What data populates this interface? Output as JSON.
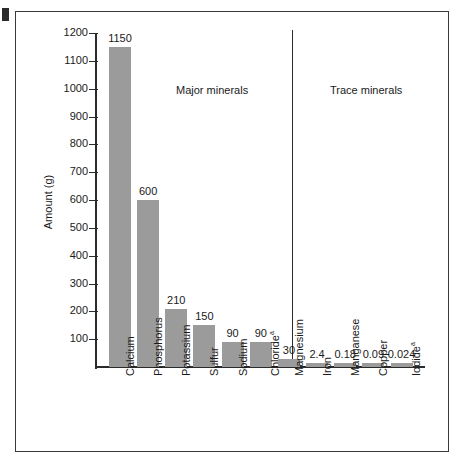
{
  "figure": {
    "y_axis_title": "Amount (g)",
    "section_labels": {
      "major": "Major minerals",
      "trace": "Trace minerals"
    },
    "tick_labels": [
      "1200",
      "1100",
      "1000",
      "900",
      "800",
      "700",
      "600",
      "500",
      "400",
      "300",
      "200",
      "100"
    ],
    "colors": {
      "bar_fill": "#9b9b9b",
      "axis": "#2b2b2b",
      "frame": "#3a3a3a",
      "text": "#1a1a1a",
      "background": "#ffffff"
    },
    "footnote_marker": "a"
  },
  "chart_data": {
    "type": "bar",
    "title": "",
    "xlabel": "",
    "ylabel": "Amount (g)",
    "ylim": [
      0,
      1200
    ],
    "ytick_step": 100,
    "grid": false,
    "legend": "none",
    "annotations": [
      "Major minerals",
      "Trace minerals"
    ],
    "groups": [
      {
        "name": "Major minerals",
        "categories": [
          "Calcium",
          "Phosphorus",
          "Potassium",
          "Sulfur",
          "Sodium",
          "Chloride",
          "Magnesium"
        ]
      },
      {
        "name": "Trace minerals",
        "categories": [
          "Iron",
          "Manganese",
          "Copper",
          "Iodide"
        ]
      }
    ],
    "categories": [
      "Calcium",
      "Phosphorus",
      "Potassium",
      "Sulfur",
      "Sodium",
      "Chloride",
      "Magnesium",
      "Iron",
      "Manganese",
      "Copper",
      "Iodide"
    ],
    "values": [
      1150,
      600,
      210,
      150,
      90,
      90,
      30,
      2.4,
      0.18,
      0.09,
      0.024
    ],
    "value_labels": [
      "1150",
      "600",
      "210",
      "150",
      "90",
      "90",
      "30",
      "2.4",
      "0.18",
      "0.09",
      "0.024"
    ],
    "category_labels": [
      "Calcium",
      "Phosphorus",
      "Potassium",
      "Sulfur",
      "Sodium",
      "Chloride",
      "Magnesium",
      "Iron",
      "Manganese",
      "Copper",
      "Iodide"
    ],
    "category_footnotes": [
      "",
      "",
      "",
      "",
      "",
      "a",
      "",
      "",
      "",
      "",
      "a"
    ],
    "bars": [
      {
        "label": "Calcium",
        "value": 1150,
        "value_label": "1150",
        "footnote": "",
        "group": "major"
      },
      {
        "label": "Phosphorus",
        "value": 600,
        "value_label": "600",
        "footnote": "",
        "group": "major"
      },
      {
        "label": "Potassium",
        "value": 210,
        "value_label": "210",
        "footnote": "",
        "group": "major"
      },
      {
        "label": "Sulfur",
        "value": 150,
        "value_label": "150",
        "footnote": "",
        "group": "major"
      },
      {
        "label": "Sodium",
        "value": 90,
        "value_label": "90",
        "footnote": "",
        "group": "major"
      },
      {
        "label": "Chloride",
        "value": 90,
        "value_label": "90",
        "footnote": "a",
        "group": "major"
      },
      {
        "label": "Magnesium",
        "value": 30,
        "value_label": "30",
        "footnote": "",
        "group": "major"
      },
      {
        "label": "Iron",
        "value": 2.4,
        "value_label": "2.4",
        "footnote": "",
        "group": "trace"
      },
      {
        "label": "Manganese",
        "value": 0.18,
        "value_label": "0.18",
        "footnote": "",
        "group": "trace"
      },
      {
        "label": "Copper",
        "value": 0.09,
        "value_label": "0.09",
        "footnote": "",
        "group": "trace"
      },
      {
        "label": "Iodide",
        "value": 0.024,
        "value_label": "0.024",
        "footnote": "a",
        "group": "trace"
      }
    ]
  }
}
